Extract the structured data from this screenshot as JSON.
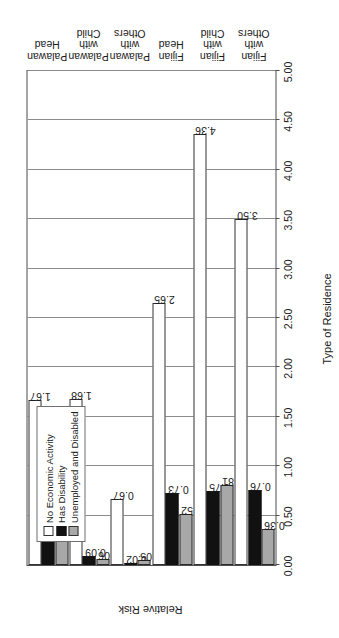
{
  "chart_data": {
    "type": "bar",
    "title": "",
    "xlabel": "Type of Residence",
    "ylabel": "Relative Risk",
    "ylim": [
      0.0,
      5.0
    ],
    "ytick_labels": [
      "0.00",
      "0.50",
      "1.00",
      "1.50",
      "2.00",
      "2.50",
      "3.00",
      "3.50",
      "4.00",
      "4.50",
      "5.00"
    ],
    "ytick_values": [
      0.0,
      0.5,
      1.0,
      1.5,
      2.0,
      2.5,
      3.0,
      3.5,
      4.0,
      4.5,
      5.0
    ],
    "grid": true,
    "orientation": "bar-vertical-page-rotated-90",
    "legend_position": "upper-left",
    "categories": [
      "Palawan Head",
      "Palawan with\nChild",
      "Palawan with\nOthers",
      "Fijian Head",
      "Fijian with Child",
      "Fijian with Others"
    ],
    "series": [
      {
        "name": "No Economic Activity",
        "color": "#ffffff",
        "values": [
          1.67,
          1.68,
          0.67,
          2.65,
          4.36,
          3.5
        ],
        "labels": [
          "1.67",
          "1.68",
          "0.67",
          "2.65",
          "4.36",
          "3.50"
        ]
      },
      {
        "name": "Has Disability",
        "color": "#111111",
        "values": [
          0.58,
          0.09,
          0.02,
          0.73,
          0.75,
          0.76
        ],
        "labels": [
          "0.58",
          "0.09",
          "0.02",
          "0.73",
          "0.75",
          "0.76"
        ]
      },
      {
        "name": "Unemployed and Disabled",
        "color": "#a8a8a8",
        "values": [
          0.75,
          0.06,
          0.05,
          0.52,
          0.81,
          0.36
        ],
        "labels": [
          "0.75",
          "0.06",
          "0.05",
          "0.52",
          "0.81",
          "0.36"
        ]
      }
    ]
  },
  "legend": {
    "items": [
      {
        "label": "No Economic Activity",
        "swatch": "white"
      },
      {
        "label": "Has Disability",
        "swatch": "black"
      },
      {
        "label": "Unemployed and Disabled",
        "swatch": "gray"
      }
    ]
  },
  "axes": {
    "y_title": "Relative Risk",
    "x_title": "Type of Residence"
  }
}
